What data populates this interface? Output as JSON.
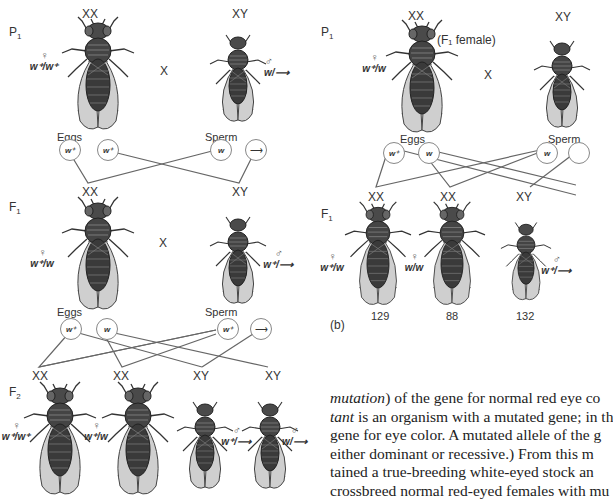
{
  "panel_a": {
    "p1": {
      "generation": "P",
      "generation_sub": "1",
      "female": {
        "chromosomes": "XX",
        "sex_symbol": "♀",
        "genotype": "w⁺/w⁺"
      },
      "male": {
        "chromosomes": "XY",
        "sex_symbol": "♂",
        "genotype": "w/⟶"
      },
      "cross": "X"
    },
    "gametes_1": {
      "eggs_label": "Eggs",
      "sperm_label": "Sperm",
      "eggs": [
        "w⁺",
        "w⁺"
      ],
      "sperm": [
        "w",
        "⟶"
      ],
      "offspring": [
        "XX",
        "XY"
      ]
    },
    "f1": {
      "generation": "F",
      "generation_sub": "1",
      "female": {
        "chromosomes": "XX",
        "sex_symbol": "♀",
        "genotype": "w⁺/w"
      },
      "male": {
        "sex_symbol": "♂",
        "genotype": "w⁺/⟶"
      },
      "cross": "X"
    },
    "gametes_2": {
      "eggs_label": "Eggs",
      "sperm_label": "Sperm",
      "eggs": [
        "w⁺",
        "w"
      ],
      "sperm": [
        "w⁺",
        "⟶"
      ],
      "offspring": [
        "XX",
        "XX",
        "XY",
        "XY"
      ]
    },
    "f2": {
      "generation": "F",
      "generation_sub": "2",
      "flies": [
        {
          "chromosomes": "XX",
          "sex_symbol": "♀",
          "genotype": "w⁺/w⁺"
        },
        {
          "chromosomes": "XX",
          "sex_symbol": "♀",
          "genotype": "w⁺/w"
        },
        {
          "chromosomes": "XY",
          "sex_symbol": "♂",
          "genotype": "w⁺/⟶"
        },
        {
          "chromosomes": "XY",
          "sex_symbol": "♂",
          "genotype": "w/⟶"
        }
      ]
    }
  },
  "panel_b": {
    "label": "(b)",
    "p1": {
      "generation": "P",
      "generation_sub": "1",
      "female": {
        "chromosomes": "XX",
        "note": "(F₁ female)",
        "sex_symbol": "♀",
        "genotype": "w⁺/w"
      },
      "male": {
        "chromosomes": "XY"
      },
      "cross": "X"
    },
    "gametes": {
      "eggs_label": "Eggs",
      "sperm_label": "Sperm",
      "eggs": [
        "w⁺",
        "w"
      ],
      "sperm": [
        "w"
      ],
      "offspring": [
        "XX",
        "XX",
        "XY"
      ]
    },
    "f1": {
      "generation": "F",
      "generation_sub": "1",
      "flies": [
        {
          "sex_symbol": "♀",
          "genotype": "w⁺/w",
          "count": "129"
        },
        {
          "sex_symbol": "♀",
          "genotype": "w/w",
          "count": "88"
        },
        {
          "sex_symbol": "♂",
          "genotype": "w⁺/⟶",
          "count": "132"
        }
      ]
    }
  },
  "text": {
    "lines": [
      {
        "italic": "mutation",
        "rest": ") of the gene for normal red eye co"
      },
      {
        "italic": "tant",
        "rest": " is an organism with a mutated gene; in th"
      },
      {
        "italic": "",
        "rest": "gene for eye color. A mutated allele of the g"
      },
      {
        "italic": "",
        "rest": "either dominant or recessive.) From this m"
      },
      {
        "italic": "",
        "rest": "tained a true-breeding white-eyed stock an"
      },
      {
        "italic": "",
        "rest": "crossbreed normal red-eyed females with mu"
      }
    ]
  },
  "colors": {
    "ink": "#333333",
    "line": "#666666",
    "body_dark": "#3a3a3a",
    "wing": "#c9c9c9"
  }
}
